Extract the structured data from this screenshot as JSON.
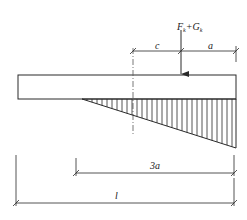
{
  "diagram": {
    "type": "foundation-base-pressure",
    "colors": {
      "stroke": "#2a2a2a",
      "background": "#ffffff"
    },
    "load_label": {
      "main": "F",
      "sub1": "k",
      "plus": "+G",
      "sub2": "k"
    },
    "dimensions": {
      "c": "c",
      "a": "a",
      "three_a": "3a",
      "l": "l"
    }
  }
}
